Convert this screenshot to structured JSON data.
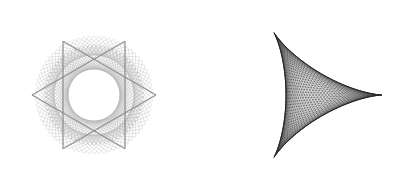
{
  "figures": [
    {
      "name": "rosette-star",
      "type": "string-art-rosette",
      "center": [
        94,
        95
      ],
      "outer_radius": 74,
      "inner_radius": 26,
      "line_count": 72,
      "line_color": "#b8b8b8",
      "star_color": "#8a8a8a",
      "star_size": 62
    },
    {
      "name": "deltoid",
      "type": "string-art-deltoid",
      "center": [
        310,
        95
      ],
      "radius": 72,
      "rotation_deg": 0,
      "line_count": 90,
      "line_color": "#3a3a3a"
    }
  ]
}
